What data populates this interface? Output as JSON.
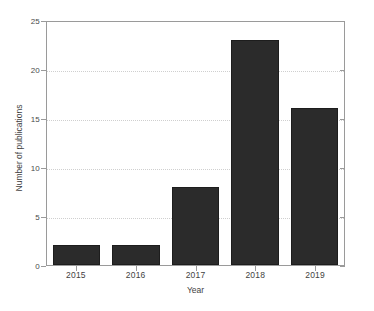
{
  "chart_data": {
    "type": "bar",
    "title": "",
    "subtitle": "",
    "categories": [
      "2015",
      "2016",
      "2017",
      "2018",
      "2019"
    ],
    "values": [
      2,
      2,
      8,
      23,
      16
    ],
    "series": [
      {
        "name": "Number of publications",
        "values": [
          2,
          2,
          8,
          23,
          16
        ]
      }
    ],
    "xlabel": "Year",
    "ylabel": "Number of publications",
    "ylim": [
      0,
      25
    ],
    "yticks": [
      0,
      5,
      10,
      15,
      20,
      25
    ],
    "ytick_labels": [
      "0",
      "5",
      "10",
      "15",
      "20",
      "25"
    ],
    "xtick_labels": [
      "2015",
      "2016",
      "2017",
      "2018",
      "2019"
    ],
    "grid": "horizontal-dotted",
    "legend": "none",
    "bar_color": "#2b2b2b",
    "grid_color": "#cfcfcf",
    "axis_color": "#9a9a9a",
    "background_color": "#ffffff",
    "annotations": []
  }
}
